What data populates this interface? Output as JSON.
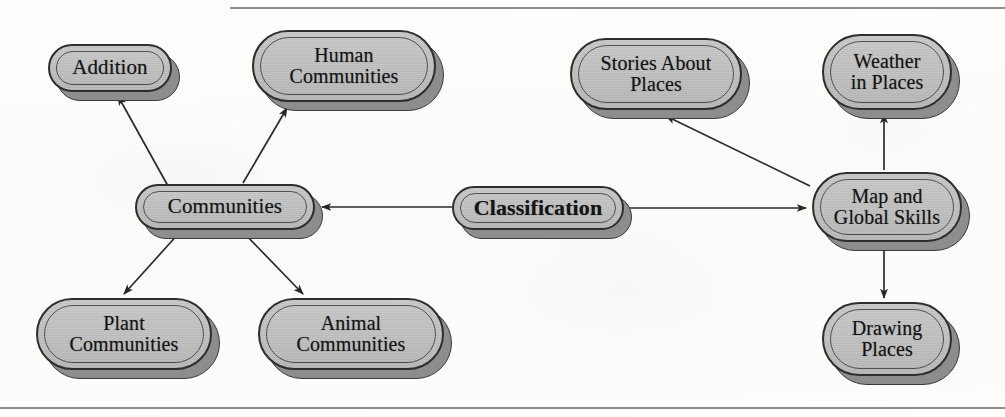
{
  "diagram": {
    "background_color": "#fdfdfb",
    "node_fill_color": "#c2c2c2",
    "node_border_color": "#2e2e2e",
    "node_shadow_color": "#8d8d8d",
    "edge_color": "#2b2b2b",
    "rules": [
      {
        "name": "top-rule",
        "x": 230,
        "y": 7,
        "width": 775,
        "height": 2
      },
      {
        "name": "bottom-rule",
        "x": 0,
        "y": 407,
        "width": 1005,
        "height": 2
      }
    ],
    "nodes": [
      {
        "id": "addition",
        "label": "Addition",
        "x": 48,
        "y": 44,
        "w": 124,
        "h": 48,
        "lines": 1,
        "bold": false
      },
      {
        "id": "human",
        "label": "Human\nCommunities",
        "x": 252,
        "y": 30,
        "w": 184,
        "h": 72,
        "lines": 2,
        "bold": false
      },
      {
        "id": "stories",
        "label": "Stories About\nPlaces",
        "x": 570,
        "y": 38,
        "w": 172,
        "h": 72,
        "lines": 2,
        "bold": false
      },
      {
        "id": "weather",
        "label": "Weather\nin Places",
        "x": 822,
        "y": 34,
        "w": 130,
        "h": 76,
        "lines": 2,
        "bold": false
      },
      {
        "id": "communities",
        "label": "Communities",
        "x": 135,
        "y": 184,
        "w": 180,
        "h": 46,
        "lines": 1,
        "bold": false
      },
      {
        "id": "classification",
        "label": "Classification",
        "x": 452,
        "y": 186,
        "w": 172,
        "h": 44,
        "lines": 1,
        "bold": true
      },
      {
        "id": "map-global",
        "label": "Map and\nGlobal Skills",
        "x": 812,
        "y": 172,
        "w": 150,
        "h": 70,
        "lines": 2,
        "bold": false
      },
      {
        "id": "plant",
        "label": "Plant\nCommunities",
        "x": 36,
        "y": 298,
        "w": 176,
        "h": 72,
        "lines": 2,
        "bold": false
      },
      {
        "id": "animal",
        "label": "Animal\nCommunities",
        "x": 258,
        "y": 298,
        "w": 186,
        "h": 72,
        "lines": 2,
        "bold": false
      },
      {
        "id": "drawing",
        "label": "Drawing\nPlaces",
        "x": 822,
        "y": 302,
        "w": 130,
        "h": 74,
        "lines": 2,
        "bold": false
      }
    ],
    "edges": [
      {
        "id": "communities-to-addition",
        "from": "communities",
        "to": "addition",
        "x1": 168,
        "y1": 186,
        "x2": 118,
        "y2": 96,
        "arrow": "end"
      },
      {
        "id": "communities-to-human",
        "from": "communities",
        "to": "human",
        "x1": 243,
        "y1": 183,
        "x2": 287,
        "y2": 108,
        "arrow": "end"
      },
      {
        "id": "communities-to-plant",
        "from": "communities",
        "to": "plant",
        "x1": 180,
        "y1": 232,
        "x2": 124,
        "y2": 294,
        "arrow": "end"
      },
      {
        "id": "communities-to-animal",
        "from": "communities",
        "to": "animal",
        "x1": 243,
        "y1": 232,
        "x2": 303,
        "y2": 294,
        "arrow": "end"
      },
      {
        "id": "classification-to-communities",
        "from": "classification",
        "to": "communities",
        "x1": 452,
        "y1": 207,
        "x2": 322,
        "y2": 207,
        "arrow": "end"
      },
      {
        "id": "classification-to-map",
        "from": "classification",
        "to": "map-global",
        "x1": 626,
        "y1": 208,
        "x2": 806,
        "y2": 208,
        "arrow": "end"
      },
      {
        "id": "map-to-stories",
        "from": "map-global",
        "to": "stories",
        "x1": 810,
        "y1": 186,
        "x2": 666,
        "y2": 116,
        "arrow": "end"
      },
      {
        "id": "map-to-weather",
        "from": "map-global",
        "to": "weather",
        "x1": 884,
        "y1": 170,
        "x2": 884,
        "y2": 114,
        "arrow": "end"
      },
      {
        "id": "map-to-drawing",
        "from": "map-global",
        "to": "drawing",
        "x1": 884,
        "y1": 244,
        "x2": 884,
        "y2": 298,
        "arrow": "end"
      }
    ]
  }
}
